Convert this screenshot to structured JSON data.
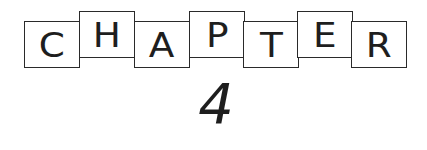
{
  "title": {
    "word": "CHAPTER",
    "letters": [
      "C",
      "H",
      "A",
      "P",
      "T",
      "E",
      "R"
    ],
    "number": "4"
  },
  "colors": {
    "ink": "#1e1e1e",
    "background": "#ffffff"
  }
}
